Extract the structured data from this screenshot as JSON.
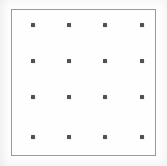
{
  "figure": {
    "name": "dot-grid-calibration-pattern",
    "canvas_width": 167,
    "canvas_height": 166,
    "background_color": "#fdfdfd"
  },
  "frame": {
    "x": 11,
    "y": 9,
    "width": 145,
    "height": 147,
    "border_color": "#9a9a9a",
    "border_width": 1,
    "fill_color": "#fefefe"
  },
  "grid": {
    "rows": 4,
    "columns": 4,
    "dot_count": 16,
    "dot_color": "#4b4b4b",
    "dot_size": 4,
    "column_x": [
      33,
      69,
      105,
      142
    ],
    "row_y": [
      25,
      61,
      97,
      137
    ],
    "dots": [
      {
        "id": "dot-r1-c1",
        "row": 1,
        "col": 1,
        "x": 33,
        "y": 25
      },
      {
        "id": "dot-r1-c2",
        "row": 1,
        "col": 2,
        "x": 69,
        "y": 25
      },
      {
        "id": "dot-r1-c3",
        "row": 1,
        "col": 3,
        "x": 105,
        "y": 25
      },
      {
        "id": "dot-r1-c4",
        "row": 1,
        "col": 4,
        "x": 142,
        "y": 25
      },
      {
        "id": "dot-r2-c1",
        "row": 2,
        "col": 1,
        "x": 33,
        "y": 61
      },
      {
        "id": "dot-r2-c2",
        "row": 2,
        "col": 2,
        "x": 69,
        "y": 61
      },
      {
        "id": "dot-r2-c3",
        "row": 2,
        "col": 3,
        "x": 105,
        "y": 61
      },
      {
        "id": "dot-r2-c4",
        "row": 2,
        "col": 4,
        "x": 142,
        "y": 61
      },
      {
        "id": "dot-r3-c1",
        "row": 3,
        "col": 1,
        "x": 33,
        "y": 97
      },
      {
        "id": "dot-r3-c2",
        "row": 3,
        "col": 2,
        "x": 69,
        "y": 97
      },
      {
        "id": "dot-r3-c3",
        "row": 3,
        "col": 3,
        "x": 105,
        "y": 97
      },
      {
        "id": "dot-r3-c4",
        "row": 3,
        "col": 4,
        "x": 142,
        "y": 97
      },
      {
        "id": "dot-r4-c1",
        "row": 4,
        "col": 1,
        "x": 33,
        "y": 137
      },
      {
        "id": "dot-r4-c2",
        "row": 4,
        "col": 2,
        "x": 69,
        "y": 137
      },
      {
        "id": "dot-r4-c3",
        "row": 4,
        "col": 3,
        "x": 105,
        "y": 137
      },
      {
        "id": "dot-r4-c4",
        "row": 4,
        "col": 4,
        "x": 142,
        "y": 137
      }
    ]
  }
}
